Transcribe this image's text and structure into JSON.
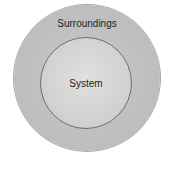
{
  "diagram": {
    "outer_circle": {
      "label": "Surroundings",
      "color": "#bdbdbd"
    },
    "inner_circle": {
      "label": "System",
      "color": "#d6d6d6",
      "border_color": "#6e6e6e"
    }
  }
}
